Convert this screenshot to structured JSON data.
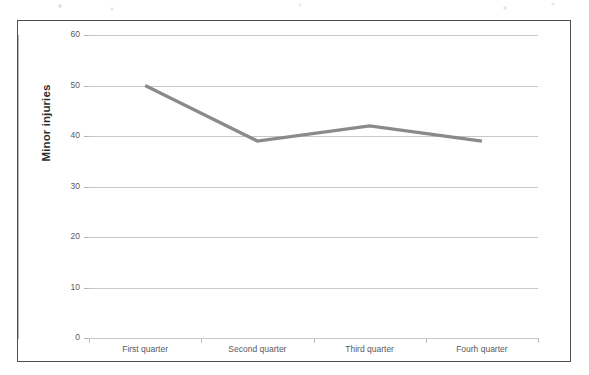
{
  "chart_data": {
    "type": "line",
    "title": "",
    "xlabel": "",
    "ylabel": "Minor injuries",
    "categories": [
      "First quarter",
      "Second quarter",
      "Third quarter",
      "Fourh quarter"
    ],
    "series": [
      {
        "name": "Minor injuries",
        "values": [
          50,
          39,
          42,
          39
        ],
        "color": "#8a8a8a"
      }
    ],
    "ylim": [
      0,
      60
    ],
    "y_ticks": [
      0,
      10,
      20,
      30,
      40,
      50,
      60
    ],
    "y_tick_labels": [
      "0",
      "10",
      "20",
      "30",
      "40",
      "50",
      "60"
    ],
    "grid": "horizontal",
    "legend": "none",
    "gridline_color": "#c8c8cc",
    "axis_color": "#b4b4b8",
    "frame_color": "#4d4d52",
    "background": "#ffffff"
  }
}
